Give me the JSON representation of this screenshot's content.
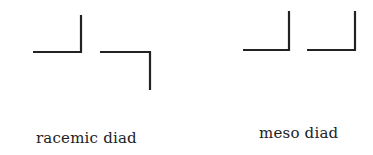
{
  "diagram": {
    "stroke_color": "#222222",
    "stroke_width": 2.2,
    "panels": [
      {
        "name": "racemic",
        "label": "racemic diad",
        "label_pos": {
          "x": 36,
          "y": 129
        },
        "shapes": [
          {
            "points": "33,52 81,52 81,15"
          },
          {
            "points": "100,52 150,52 150,90"
          }
        ]
      },
      {
        "name": "meso",
        "label": "meso diad",
        "label_pos": {
          "x": 259,
          "y": 124
        },
        "shapes": [
          {
            "points": "243,50 289,50 289,11"
          },
          {
            "points": "307,50 355,50 355,11"
          }
        ]
      }
    ]
  }
}
